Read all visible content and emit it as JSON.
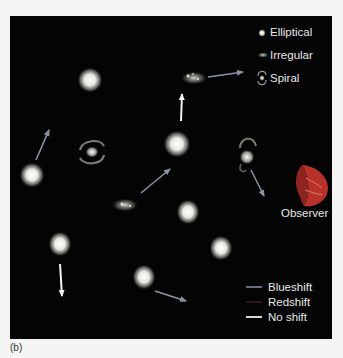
{
  "figure": {
    "caption": "(b)",
    "background_color": "#040404"
  },
  "legend": {
    "galaxy_types": [
      {
        "label": "Elliptical",
        "icon": "elliptical-galaxy-icon"
      },
      {
        "label": "Irregular",
        "icon": "irregular-galaxy-icon"
      },
      {
        "label": "Spiral",
        "icon": "spiral-galaxy-icon"
      }
    ],
    "shifts": [
      {
        "label": "Blueshift",
        "color": "#8a93a6"
      },
      {
        "label": "Redshift",
        "color": "#3a1e1e"
      },
      {
        "label": "No shift",
        "color": "#f2f2f2"
      }
    ]
  },
  "observer": {
    "label": "Observer",
    "color": "#b8322a"
  },
  "galaxies": [
    {
      "type": "elliptical",
      "x": 90,
      "y": 80
    },
    {
      "type": "irregular",
      "x": 194,
      "y": 78
    },
    {
      "type": "spiral",
      "x": 92,
      "y": 152
    },
    {
      "type": "elliptical",
      "x": 177,
      "y": 144
    },
    {
      "type": "spiral",
      "x": 247,
      "y": 155
    },
    {
      "type": "elliptical",
      "x": 32,
      "y": 175
    },
    {
      "type": "irregular",
      "x": 126,
      "y": 205
    },
    {
      "type": "elliptical",
      "x": 188,
      "y": 212
    },
    {
      "type": "elliptical",
      "x": 221,
      "y": 248
    },
    {
      "type": "elliptical",
      "x": 60,
      "y": 244
    },
    {
      "type": "elliptical",
      "x": 144,
      "y": 277
    }
  ],
  "arrows": [
    {
      "shift": "blueshift",
      "from": [
        36,
        160
      ],
      "to": [
        49,
        130
      ]
    },
    {
      "shift": "blueshift",
      "from": [
        208,
        77
      ],
      "to": [
        243,
        72
      ]
    },
    {
      "shift": "noshift",
      "from": [
        181,
        121
      ],
      "to": [
        182,
        94
      ]
    },
    {
      "shift": "blueshift",
      "from": [
        141,
        193
      ],
      "to": [
        170,
        169
      ]
    },
    {
      "shift": "blueshift",
      "from": [
        251,
        170
      ],
      "to": [
        264,
        196
      ]
    },
    {
      "shift": "noshift",
      "from": [
        60,
        264
      ],
      "to": [
        62,
        296
      ]
    },
    {
      "shift": "blueshift",
      "from": [
        155,
        291
      ],
      "to": [
        186,
        301
      ]
    }
  ]
}
